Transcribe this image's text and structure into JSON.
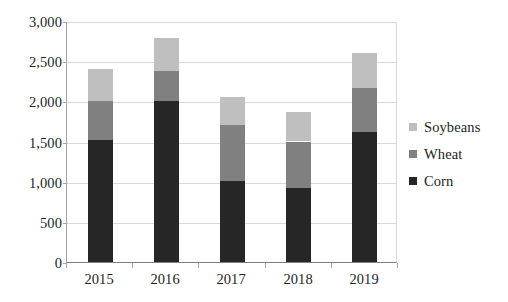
{
  "chart_data": {
    "type": "bar",
    "subtype": "stacked-vertical",
    "title": "",
    "xlabel": "",
    "ylabel": "",
    "categories": [
      "2015",
      "2016",
      "2017",
      "2018",
      "2019"
    ],
    "series": [
      {
        "name": "Corn",
        "color": "#262626",
        "values": [
          1520,
          2000,
          1010,
          920,
          1620
        ]
      },
      {
        "name": "Wheat",
        "color": "#808080",
        "values": [
          480,
          380,
          690,
          580,
          540
        ]
      },
      {
        "name": "Soybeans",
        "color": "#bfbfbf",
        "values": [
          400,
          410,
          360,
          370,
          440
        ]
      }
    ],
    "totals": [
      2400,
      2790,
      2060,
      1870,
      2600
    ],
    "ylim": [
      0,
      3000
    ],
    "ytick_values": [
      0,
      500,
      1000,
      1500,
      2000,
      2500,
      3000
    ],
    "ytick_labels": [
      "0",
      "500",
      "1,000",
      "1,500",
      "2,000",
      "2,500",
      "3,000"
    ],
    "grid": true,
    "grid_axis": "y",
    "legend_position": "right",
    "legend_order": [
      "Soybeans",
      "Wheat",
      "Corn"
    ],
    "background_color": "#ffffff",
    "gridline_color": "#d9d9d9",
    "axis_color": "#a6a6a6",
    "text_color": "#231f20"
  }
}
